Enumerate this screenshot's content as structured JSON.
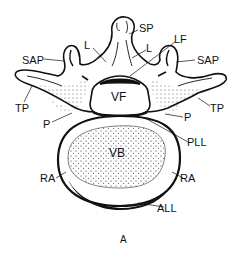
{
  "figure": {
    "panel_label": "A",
    "labels": {
      "sp": "SP",
      "l_left": "L",
      "l_right": "L",
      "lf": "LF",
      "sap_left": "SAP",
      "sap_right": "SAP",
      "tp_left": "TP",
      "tp_right": "TP",
      "p_left": "P",
      "p_right": "P",
      "vf": "VF",
      "pll": "PLL",
      "vb": "VB",
      "ra_left": "RA",
      "ra_right": "RA",
      "all": "ALL"
    },
    "colors": {
      "ink": "#111111",
      "background": "#ffffff"
    }
  }
}
